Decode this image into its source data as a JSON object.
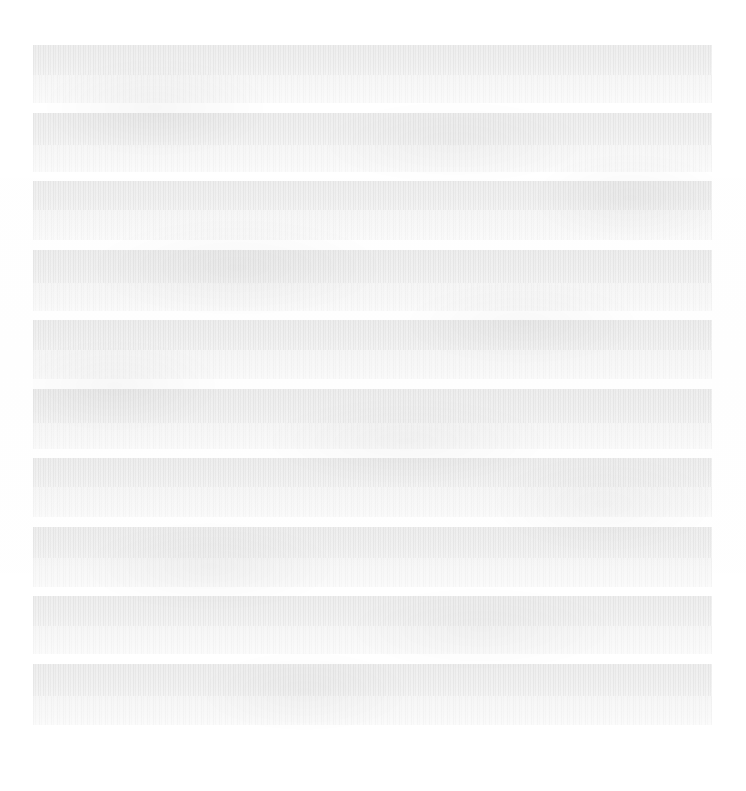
{
  "page": {
    "kind": "scanned-document-page",
    "legible_text": "",
    "note_to_reader": "No characters are resolvable at any magnification; the page renders as faded text bands only.",
    "background_color": "#ffffff",
    "width_px": 746,
    "height_px": 791
  },
  "content_area": {
    "left_px": 33,
    "top_px": 45,
    "width_px": 679,
    "height_px": 695,
    "block_count": 10
  },
  "palette": {
    "page_white": "#ffffff",
    "band_dense": "#f1f1f1",
    "band_light": "#f9f9f9",
    "gutter_white": "#fdfdfd"
  },
  "blocks": [
    {
      "id": "block-1",
      "label": "",
      "dense_height_px": 30,
      "light_height_px": 28,
      "gap_after_px": 10
    },
    {
      "id": "block-2",
      "label": "",
      "dense_height_px": 32,
      "light_height_px": 27,
      "gap_after_px": 9
    },
    {
      "id": "block-3",
      "label": "",
      "dense_height_px": 29,
      "light_height_px": 30,
      "gap_after_px": 10
    },
    {
      "id": "block-4",
      "label": "",
      "dense_height_px": 33,
      "light_height_px": 28,
      "gap_after_px": 9
    },
    {
      "id": "block-5",
      "label": "",
      "dense_height_px": 30,
      "light_height_px": 29,
      "gap_after_px": 10
    },
    {
      "id": "block-6",
      "label": "",
      "dense_height_px": 34,
      "light_height_px": 26,
      "gap_after_px": 9
    },
    {
      "id": "block-7",
      "label": "",
      "dense_height_px": 29,
      "light_height_px": 30,
      "gap_after_px": 10
    },
    {
      "id": "block-8",
      "label": "",
      "dense_height_px": 31,
      "light_height_px": 29,
      "gap_after_px": 9
    },
    {
      "id": "block-9",
      "label": "",
      "dense_height_px": 30,
      "light_height_px": 28,
      "gap_after_px": 10
    },
    {
      "id": "block-10",
      "label": "",
      "dense_height_px": 32,
      "light_height_px": 29,
      "gap_after_px": 0
    }
  ]
}
